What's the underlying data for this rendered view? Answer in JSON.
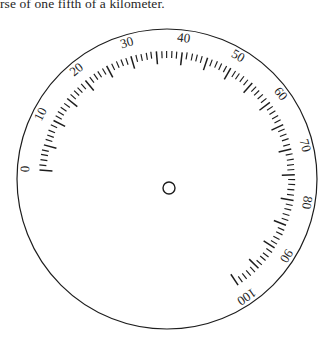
{
  "caption": {
    "text": "rse of one fifth of a kilometer."
  },
  "figure": {
    "name": "circular-graduated-dial",
    "background_color": "#ffffff",
    "ink_color": "#1d1d1d",
    "outer_circle": {
      "center_x": 167,
      "center_y": 171,
      "radius": 150,
      "stroke_width": 1.2
    },
    "center_pivot": {
      "center_x": 169,
      "center_y": 180,
      "radius": 6,
      "stroke_width": 1.4
    },
    "scale": {
      "min_value": 0,
      "max_value": 100,
      "minor_tick_step": 1,
      "major_tick_step": 5,
      "label_step": 10,
      "start_angle_deg": -86,
      "end_angle_deg": 146,
      "tick_arc_radius": 128,
      "minor_tick_length": 7,
      "major_tick_length": 13,
      "label_radius": 141,
      "direction": "clockwise"
    },
    "scale_labels": [
      {
        "value": "0",
        "number": 0
      },
      {
        "value": "10",
        "number": 10
      },
      {
        "value": "20",
        "number": 20
      },
      {
        "value": "30",
        "number": 30
      },
      {
        "value": "40",
        "number": 40
      },
      {
        "value": "50",
        "number": 50
      },
      {
        "value": "60",
        "number": 60
      },
      {
        "value": "70",
        "number": 70
      },
      {
        "value": "80",
        "number": 80
      },
      {
        "value": "90",
        "number": 90
      },
      {
        "value": "100",
        "number": 100
      }
    ]
  }
}
